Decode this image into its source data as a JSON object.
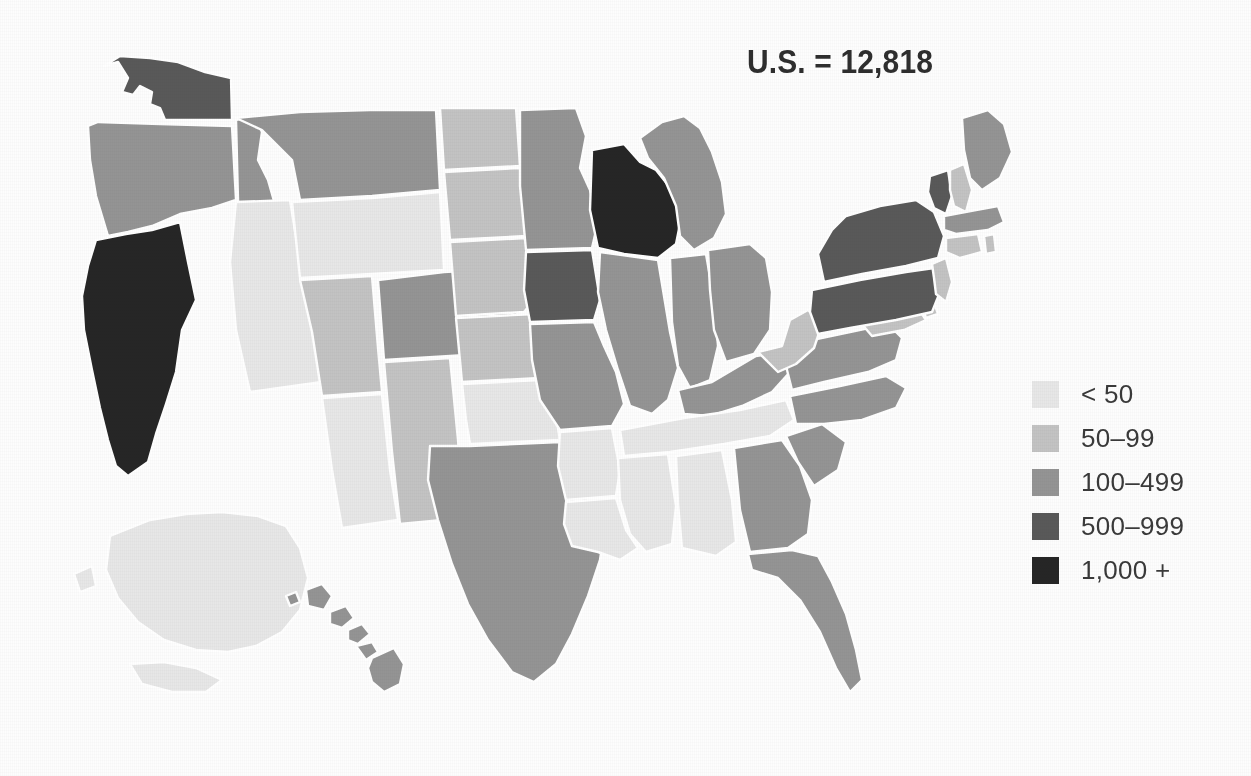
{
  "figure": {
    "kind": "choropleth-map",
    "region": "United States",
    "background_color": "#fdfdfd",
    "border_color": "#ffffff"
  },
  "title": {
    "text": "U.S. = 12,818",
    "color": "#2e2e2e"
  },
  "legend": {
    "position": "right",
    "items": [
      {
        "label": "< 50",
        "color": "#e7e7e7"
      },
      {
        "label": "50–99",
        "color": "#c3c3c3"
      },
      {
        "label": "100–499",
        "color": "#949494"
      },
      {
        "label": "500–999",
        "color": "#595959"
      },
      {
        "label": "1,000 +",
        "color": "#262626"
      }
    ]
  },
  "chart_data": {
    "type": "map",
    "title": "U.S. = 12,818",
    "total_label": "U.S.",
    "total_value": "12,818",
    "classification": "binned-choropleth",
    "bins": [
      {
        "label": "< 50",
        "min": 0,
        "max": 49,
        "color": "#e7e7e7"
      },
      {
        "label": "50–99",
        "min": 50,
        "max": 99,
        "color": "#c3c3c3"
      },
      {
        "label": "100–499",
        "min": 100,
        "max": 499,
        "color": "#949494"
      },
      {
        "label": "500–999",
        "min": 500,
        "max": 999,
        "color": "#595959"
      },
      {
        "label": "1,000 +",
        "min": 1000,
        "max": null,
        "color": "#262626"
      }
    ],
    "legend_position": "right",
    "grid": false,
    "regions": [
      {
        "code": "AL",
        "name": "Alabama",
        "bin": "< 50"
      },
      {
        "code": "AK",
        "name": "Alaska",
        "bin": "< 50"
      },
      {
        "code": "AZ",
        "name": "Arizona",
        "bin": "< 50"
      },
      {
        "code": "AR",
        "name": "Arkansas",
        "bin": "< 50"
      },
      {
        "code": "CA",
        "name": "California",
        "bin": "1,000 +"
      },
      {
        "code": "CO",
        "name": "Colorado",
        "bin": "100–499"
      },
      {
        "code": "CT",
        "name": "Connecticut",
        "bin": "50–99"
      },
      {
        "code": "DE",
        "name": "Delaware",
        "bin": "50–99"
      },
      {
        "code": "FL",
        "name": "Florida",
        "bin": "100–499"
      },
      {
        "code": "GA",
        "name": "Georgia",
        "bin": "100–499"
      },
      {
        "code": "HI",
        "name": "Hawaii",
        "bin": "100–499"
      },
      {
        "code": "ID",
        "name": "Idaho",
        "bin": "100–499"
      },
      {
        "code": "IL",
        "name": "Illinois",
        "bin": "100–499"
      },
      {
        "code": "IN",
        "name": "Indiana",
        "bin": "100–499"
      },
      {
        "code": "IA",
        "name": "Iowa",
        "bin": "500–999"
      },
      {
        "code": "KS",
        "name": "Kansas",
        "bin": "50–99"
      },
      {
        "code": "KY",
        "name": "Kentucky",
        "bin": "100–499"
      },
      {
        "code": "LA",
        "name": "Louisiana",
        "bin": "< 50"
      },
      {
        "code": "ME",
        "name": "Maine",
        "bin": "100–499"
      },
      {
        "code": "MD",
        "name": "Maryland",
        "bin": "50–99"
      },
      {
        "code": "MA",
        "name": "Massachusetts",
        "bin": "100–499"
      },
      {
        "code": "MI",
        "name": "Michigan",
        "bin": "100–499"
      },
      {
        "code": "MN",
        "name": "Minnesota",
        "bin": "100–499"
      },
      {
        "code": "MS",
        "name": "Mississippi",
        "bin": "< 50"
      },
      {
        "code": "MO",
        "name": "Missouri",
        "bin": "100–499"
      },
      {
        "code": "MT",
        "name": "Montana",
        "bin": "100–499"
      },
      {
        "code": "NE",
        "name": "Nebraska",
        "bin": "50–99"
      },
      {
        "code": "NV",
        "name": "Nevada",
        "bin": "< 50"
      },
      {
        "code": "NH",
        "name": "New Hampshire",
        "bin": "50–99"
      },
      {
        "code": "NJ",
        "name": "New Jersey",
        "bin": "50–99"
      },
      {
        "code": "NM",
        "name": "New Mexico",
        "bin": "50–99"
      },
      {
        "code": "NY",
        "name": "New York",
        "bin": "500–999"
      },
      {
        "code": "NC",
        "name": "North Carolina",
        "bin": "100–499"
      },
      {
        "code": "ND",
        "name": "North Dakota",
        "bin": "50–99"
      },
      {
        "code": "OH",
        "name": "Ohio",
        "bin": "100–499"
      },
      {
        "code": "OK",
        "name": "Oklahoma",
        "bin": "< 50"
      },
      {
        "code": "OR",
        "name": "Oregon",
        "bin": "100–499"
      },
      {
        "code": "PA",
        "name": "Pennsylvania",
        "bin": "500–999"
      },
      {
        "code": "RI",
        "name": "Rhode Island",
        "bin": "50–99"
      },
      {
        "code": "SC",
        "name": "South Carolina",
        "bin": "100–499"
      },
      {
        "code": "SD",
        "name": "South Dakota",
        "bin": "50–99"
      },
      {
        "code": "TN",
        "name": "Tennessee",
        "bin": "< 50"
      },
      {
        "code": "TX",
        "name": "Texas",
        "bin": "100–499"
      },
      {
        "code": "UT",
        "name": "Utah",
        "bin": "50–99"
      },
      {
        "code": "VT",
        "name": "Vermont",
        "bin": "500–999"
      },
      {
        "code": "VA",
        "name": "Virginia",
        "bin": "100–499"
      },
      {
        "code": "WA",
        "name": "Washington",
        "bin": "500–999"
      },
      {
        "code": "WV",
        "name": "West Virginia",
        "bin": "50–99"
      },
      {
        "code": "WI",
        "name": "Wisconsin",
        "bin": "1,000 +"
      },
      {
        "code": "WY",
        "name": "Wyoming",
        "bin": "< 50"
      }
    ]
  }
}
